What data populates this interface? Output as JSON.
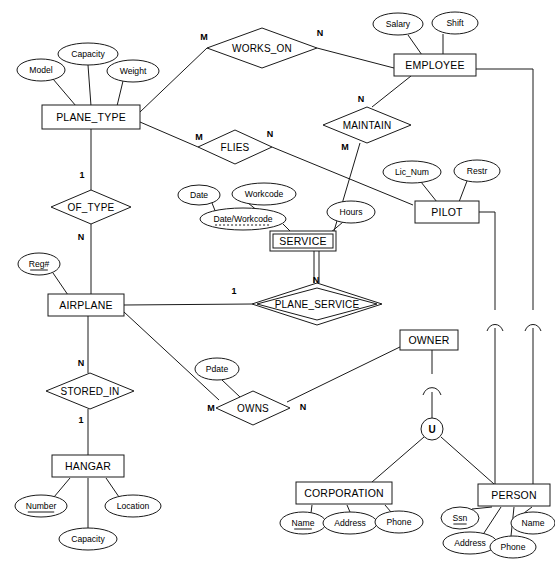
{
  "diagram": {
    "notation": "Chen ER with weak entities, identifying relationships, and a union (category) subclass",
    "colors": {
      "stroke": "#1a1a1a",
      "fill": "#ffffff",
      "background": "#ffffff",
      "text": "#000000"
    }
  },
  "entities": [
    {
      "id": "plane_type",
      "label": "PLANE_TYPE",
      "kind": "strong",
      "x": 91,
      "y": 117,
      "w": 98,
      "h": 24
    },
    {
      "id": "employee",
      "label": "EMPLOYEE",
      "kind": "strong",
      "x": 435,
      "y": 65,
      "w": 82,
      "h": 22
    },
    {
      "id": "pilot",
      "label": "PILOT",
      "kind": "strong",
      "x": 447,
      "y": 212,
      "w": 64,
      "h": 22
    },
    {
      "id": "service",
      "label": "SERVICE",
      "kind": "weak",
      "x": 303,
      "y": 241,
      "w": 66,
      "h": 20
    },
    {
      "id": "airplane",
      "label": "AIRPLANE",
      "kind": "strong",
      "x": 86,
      "y": 305,
      "w": 76,
      "h": 22
    },
    {
      "id": "hangar",
      "label": "HANGAR",
      "kind": "strong",
      "x": 88,
      "y": 466,
      "w": 72,
      "h": 22
    },
    {
      "id": "owner",
      "label": "OWNER",
      "kind": "strong",
      "x": 429,
      "y": 340,
      "w": 58,
      "h": 20
    },
    {
      "id": "corporation",
      "label": "CORPORATION",
      "kind": "strong",
      "x": 344,
      "y": 493,
      "w": 96,
      "h": 22
    },
    {
      "id": "person",
      "label": "PERSON",
      "kind": "strong",
      "x": 514,
      "y": 495,
      "w": 72,
      "h": 22
    }
  ],
  "relationships": [
    {
      "id": "works_on",
      "label": "WORKS_ON",
      "kind": "normal",
      "x": 262,
      "y": 48,
      "rx": 55,
      "ry": 20
    },
    {
      "id": "maintain",
      "label": "MAINTAIN",
      "kind": "normal",
      "x": 367,
      "y": 125,
      "rx": 44,
      "ry": 18
    },
    {
      "id": "flies",
      "label": "FLIES",
      "kind": "normal",
      "x": 235,
      "y": 147,
      "rx": 37,
      "ry": 17
    },
    {
      "id": "of_type",
      "label": "OF_TYPE",
      "kind": "normal",
      "x": 91,
      "y": 207,
      "rx": 40,
      "ry": 17
    },
    {
      "id": "plane_service",
      "label": "PLANE_SERVICE",
      "kind": "identifying",
      "x": 317,
      "y": 304,
      "rx": 65,
      "ry": 21
    },
    {
      "id": "stored_in",
      "label": "STORED_IN",
      "kind": "normal",
      "x": 90,
      "y": 391,
      "rx": 44,
      "ry": 18
    },
    {
      "id": "owns",
      "label": "OWNS",
      "kind": "normal",
      "x": 253,
      "y": 408,
      "rx": 37,
      "ry": 17
    }
  ],
  "attributes": [
    {
      "id": "pt_model",
      "label": "Model",
      "owner": "plane_type",
      "key": "none",
      "x": 41,
      "y": 70,
      "rx": 24,
      "ry": 11
    },
    {
      "id": "pt_capacity",
      "label": "Capacity",
      "owner": "plane_type",
      "key": "none",
      "x": 88,
      "y": 54,
      "rx": 30,
      "ry": 11
    },
    {
      "id": "pt_weight",
      "label": "Weight",
      "owner": "plane_type",
      "key": "none",
      "x": 133,
      "y": 71,
      "rx": 26,
      "ry": 11
    },
    {
      "id": "emp_salary",
      "label": "Salary",
      "owner": "employee",
      "key": "none",
      "x": 398,
      "y": 24,
      "rx": 25,
      "ry": 11
    },
    {
      "id": "emp_shift",
      "label": "Shift",
      "owner": "employee",
      "key": "none",
      "x": 455,
      "y": 23,
      "rx": 23,
      "ry": 11
    },
    {
      "id": "pil_licnum",
      "label": "Lic_Num",
      "owner": "pilot",
      "key": "none",
      "x": 412,
      "y": 172,
      "rx": 29,
      "ry": 11
    },
    {
      "id": "pil_restr",
      "label": "Restr",
      "owner": "pilot",
      "key": "none",
      "x": 477,
      "y": 171,
      "rx": 23,
      "ry": 11
    },
    {
      "id": "srv_date",
      "label": "Date",
      "owner": "dateworkcode",
      "key": "none",
      "x": 199,
      "y": 195,
      "rx": 21,
      "ry": 10
    },
    {
      "id": "srv_workcode",
      "label": "Workcode",
      "owner": "dateworkcode",
      "key": "none",
      "x": 264,
      "y": 194,
      "rx": 32,
      "ry": 11
    },
    {
      "id": "dateworkcode",
      "label": "Date/Workcode",
      "owner": "service",
      "key": "partial",
      "x": 243,
      "y": 219,
      "rx": 43,
      "ry": 11
    },
    {
      "id": "srv_hours",
      "label": "Hours",
      "owner": "service",
      "key": "none",
      "x": 351,
      "y": 212,
      "rx": 24,
      "ry": 11
    },
    {
      "id": "ap_reg",
      "label": "Reg#",
      "owner": "airplane",
      "key": "primary",
      "x": 39,
      "y": 264,
      "rx": 21,
      "ry": 11
    },
    {
      "id": "hg_number",
      "label": "Number",
      "owner": "hangar",
      "key": "primary",
      "x": 41,
      "y": 506,
      "rx": 26,
      "ry": 11
    },
    {
      "id": "hg_location",
      "label": "Location",
      "owner": "hangar",
      "key": "none",
      "x": 133,
      "y": 506,
      "rx": 28,
      "ry": 11
    },
    {
      "id": "hg_capacity",
      "label": "Capacity",
      "owner": "hangar",
      "key": "none",
      "x": 88,
      "y": 539,
      "rx": 29,
      "ry": 11
    },
    {
      "id": "owns_pdate",
      "label": "Pdate",
      "owner": "owns",
      "key": "none",
      "x": 217,
      "y": 369,
      "rx": 22,
      "ry": 11
    },
    {
      "id": "corp_name",
      "label": "Name",
      "owner": "corporation",
      "key": "primary",
      "x": 303,
      "y": 523,
      "rx": 23,
      "ry": 11
    },
    {
      "id": "corp_address",
      "label": "Address",
      "owner": "corporation",
      "key": "none",
      "x": 350,
      "y": 523,
      "rx": 27,
      "ry": 11
    },
    {
      "id": "corp_phone",
      "label": "Phone",
      "owner": "corporation",
      "key": "none",
      "x": 399,
      "y": 522,
      "rx": 24,
      "ry": 11
    },
    {
      "id": "per_ssn",
      "label": "Ssn",
      "owner": "person",
      "key": "primary",
      "x": 460,
      "y": 518,
      "rx": 19,
      "ry": 11
    },
    {
      "id": "per_name",
      "label": "Name",
      "owner": "person",
      "key": "none",
      "x": 533,
      "y": 523,
      "rx": 22,
      "ry": 11
    },
    {
      "id": "per_address",
      "label": "Address",
      "owner": "person",
      "key": "none",
      "x": 470,
      "y": 543,
      "rx": 27,
      "ry": 11
    },
    {
      "id": "per_phone",
      "label": "Phone",
      "owner": "person",
      "key": "none",
      "x": 513,
      "y": 547,
      "rx": 23,
      "ry": 11
    }
  ],
  "cardinalities": [
    {
      "id": "c1",
      "text": "M",
      "x": 204,
      "y": 38,
      "rel": "works_on",
      "side": "plane_type"
    },
    {
      "id": "c2",
      "text": "N",
      "x": 320,
      "y": 34,
      "rel": "works_on",
      "side": "employee"
    },
    {
      "id": "c3",
      "text": "N",
      "x": 361,
      "y": 100,
      "rel": "maintain",
      "side": "employee"
    },
    {
      "id": "c4",
      "text": "M",
      "x": 345,
      "y": 148,
      "rel": "maintain",
      "side": "service"
    },
    {
      "id": "c5",
      "text": "M",
      "x": 199,
      "y": 138,
      "rel": "flies",
      "side": "plane_type"
    },
    {
      "id": "c6",
      "text": "N",
      "x": 270,
      "y": 135,
      "rel": "flies",
      "side": "pilot"
    },
    {
      "id": "c7",
      "text": "1",
      "x": 82,
      "y": 176,
      "rel": "of_type",
      "side": "plane_type"
    },
    {
      "id": "c8",
      "text": "N",
      "x": 81,
      "y": 238,
      "rel": "of_type",
      "side": "airplane"
    },
    {
      "id": "c9",
      "text": "1",
      "x": 234,
      "y": 292,
      "rel": "plane_service",
      "side": "airplane"
    },
    {
      "id": "c10",
      "text": "N",
      "x": 316,
      "y": 281,
      "rel": "plane_service",
      "side": "service"
    },
    {
      "id": "c11",
      "text": "N",
      "x": 81,
      "y": 364,
      "rel": "stored_in",
      "side": "airplane"
    },
    {
      "id": "c12",
      "text": "1",
      "x": 81,
      "y": 421,
      "rel": "stored_in",
      "side": "hangar"
    },
    {
      "id": "c13",
      "text": "M",
      "x": 211,
      "y": 409,
      "rel": "owns",
      "side": "airplane"
    },
    {
      "id": "c14",
      "text": "N",
      "x": 303,
      "y": 408,
      "rel": "owns",
      "side": "owner"
    }
  ],
  "category": {
    "id": "union_category",
    "symbol": "U",
    "label": "U",
    "x": 432,
    "y": 429,
    "r": 11,
    "superclass": "owner",
    "subclasses": [
      "corporation",
      "person"
    ],
    "subset_arcs": 3
  },
  "inheritance": [
    {
      "id": "pilot_is_person",
      "from": "pilot",
      "to": "person"
    },
    {
      "id": "employee_is_person",
      "from": "employee",
      "to": "person"
    }
  ]
}
